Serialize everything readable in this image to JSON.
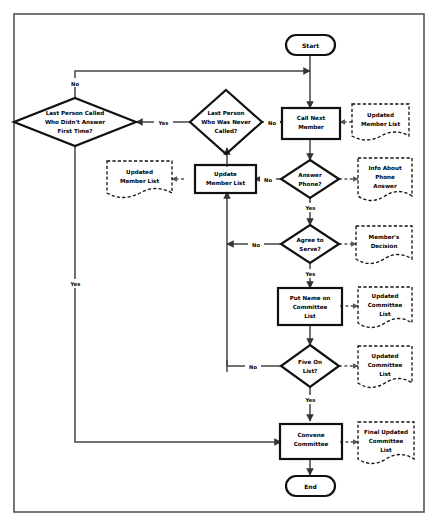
{
  "diagram": {
    "frame": {
      "name": "outer-border"
    },
    "colors": {
      "shape_stroke": "#111111",
      "connector": "#444444",
      "document_stroke": "#111111",
      "frame": "#555555",
      "background": "#ffffff"
    },
    "terminators": [
      {
        "id": "start",
        "label": "Start"
      },
      {
        "id": "end",
        "label": "End"
      }
    ],
    "processes": [
      {
        "id": "call-next-member",
        "label_lines": [
          "Call Next",
          "Member"
        ]
      },
      {
        "id": "update-member-list",
        "label_lines": [
          "Update",
          "Member List"
        ]
      },
      {
        "id": "put-name-on-committee-list",
        "label_lines": [
          "Put Name on",
          "Committee",
          "List"
        ]
      },
      {
        "id": "convene-committee",
        "label_lines": [
          "Convene",
          "Committee"
        ]
      }
    ],
    "decisions": [
      {
        "id": "last-person-called-who-didnt-answer-first-time",
        "label_lines": [
          "Last Person Called",
          "Who Didn't Answer",
          "First Time?"
        ]
      },
      {
        "id": "last-person-who-was-never-called",
        "label_lines": [
          "Last Person",
          "Who Was Never",
          "Called?"
        ]
      },
      {
        "id": "answer-phone",
        "label_lines": [
          "Answer",
          "Phone?"
        ]
      },
      {
        "id": "agree-to-serve",
        "label_lines": [
          "Agree to",
          "Serve?"
        ]
      },
      {
        "id": "five-on-list",
        "label_lines": [
          "Five On",
          "List?"
        ]
      }
    ],
    "documents": [
      {
        "id": "updated-member-list-right",
        "label_lines": [
          "Updated",
          "Member List"
        ]
      },
      {
        "id": "updated-member-list-left",
        "label_lines": [
          "Updated",
          "Member List"
        ]
      },
      {
        "id": "info-about-phone-answer",
        "label_lines": [
          "Info About",
          "Phone",
          "Answer"
        ]
      },
      {
        "id": "members-decision",
        "label_lines": [
          "Member's",
          "Decision"
        ]
      },
      {
        "id": "updated-committee-list-top",
        "label_lines": [
          "Updated",
          "Committee",
          "List"
        ]
      },
      {
        "id": "updated-committee-list-bottom",
        "label_lines": [
          "Updated",
          "Committee",
          "List"
        ]
      },
      {
        "id": "final-updated-committee-list",
        "label_lines": [
          "Final Updated",
          "Committee",
          "List"
        ]
      }
    ],
    "edge_labels": [
      {
        "id": "no-top-left",
        "text": "No"
      },
      {
        "id": "yes-between-diamonds",
        "text": "Yes"
      },
      {
        "id": "no-never-called",
        "text": "No"
      },
      {
        "id": "no-answer-phone",
        "text": "No"
      },
      {
        "id": "yes-answer-phone",
        "text": "Yes"
      },
      {
        "id": "no-agree-to-serve",
        "text": "No"
      },
      {
        "id": "yes-agree-to-serve",
        "text": "Yes"
      },
      {
        "id": "no-five-on-list",
        "text": "No"
      },
      {
        "id": "yes-five-on-list",
        "text": "Yes"
      },
      {
        "id": "yes-left-return",
        "text": "Yes"
      }
    ]
  }
}
